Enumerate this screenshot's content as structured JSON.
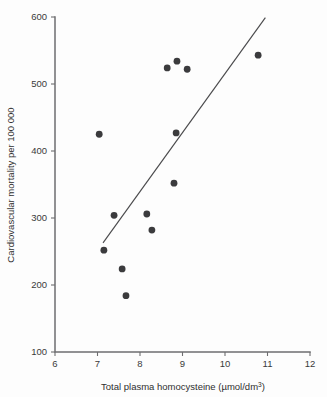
{
  "chart_data": {
    "type": "scatter",
    "title": "",
    "xlabel": "Total plasma homocysteine (µmol/dm",
    "xlabel_sup": "3",
    "xlabel_tail": ")",
    "xlabel_full": "Total plasma homocysteine (µmol/dm3)",
    "ylabel": "Cardiovascular mortality per 100 000",
    "xlim": [
      6,
      12
    ],
    "ylim": [
      100,
      600
    ],
    "xticks": [
      6,
      7,
      8,
      9,
      10,
      11,
      12
    ],
    "xtick_labels": [
      "6",
      "7",
      "8",
      "9",
      "10",
      "11",
      "12"
    ],
    "yticks": [
      100,
      200,
      300,
      400,
      500,
      600
    ],
    "ytick_labels": [
      "100",
      "200",
      "300",
      "400",
      "500",
      "600"
    ],
    "grid": false,
    "legend": null,
    "marker": "filled-circle",
    "marker_color": "#3b3b3d",
    "line_color": "#4a4a4c",
    "axis_color": "#6e6e70",
    "background": "#fdfdfd",
    "points": [
      {
        "x": 7.04,
        "y": 425
      },
      {
        "x": 7.15,
        "y": 252
      },
      {
        "x": 7.39,
        "y": 304
      },
      {
        "x": 7.58,
        "y": 224
      },
      {
        "x": 7.67,
        "y": 184
      },
      {
        "x": 8.16,
        "y": 306
      },
      {
        "x": 8.28,
        "y": 282
      },
      {
        "x": 8.64,
        "y": 524
      },
      {
        "x": 8.8,
        "y": 352
      },
      {
        "x": 8.85,
        "y": 427
      },
      {
        "x": 8.87,
        "y": 534
      },
      {
        "x": 9.11,
        "y": 522
      },
      {
        "x": 10.78,
        "y": 543
      }
    ],
    "trend_line": {
      "x_start": 7.13,
      "y_start": 263,
      "x_end": 10.95,
      "y_end": 599
    }
  }
}
